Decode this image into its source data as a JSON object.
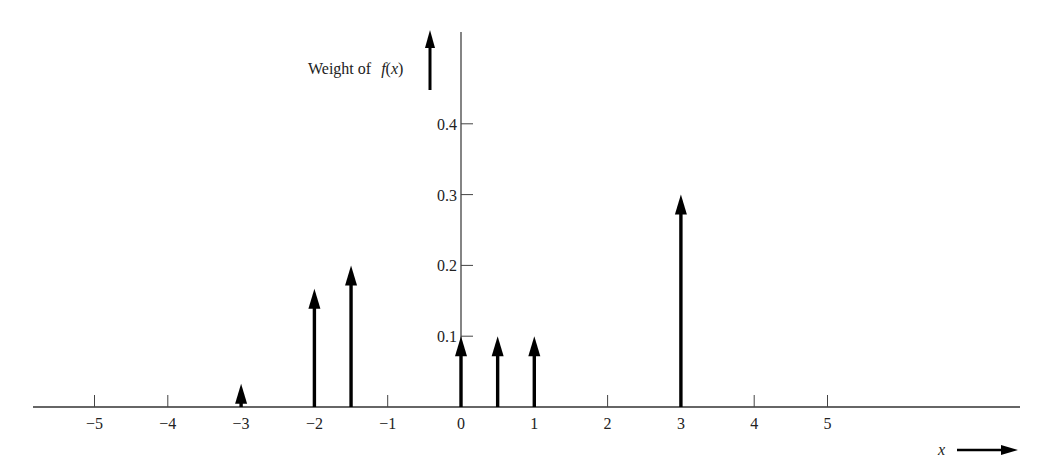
{
  "chart_data": {
    "type": "stem",
    "title": "",
    "xlabel": "x",
    "ylabel": "Weight of f(x)",
    "ylabel_parts": {
      "prefix": "Weight of ",
      "func": "f",
      "arg": "(x)"
    },
    "xlim": [
      -5.8,
      7.6
    ],
    "ylim": [
      0,
      0.45
    ],
    "x_ticks": [
      -5,
      -4,
      -3,
      -2,
      -1,
      0,
      1,
      2,
      3,
      4,
      5
    ],
    "x_tick_labels": [
      "−5",
      "−4",
      "−3",
      "−2",
      "−1",
      "0",
      "1",
      "2",
      "3",
      "4",
      "5"
    ],
    "y_ticks": [
      0.1,
      0.2,
      0.3,
      0.4
    ],
    "y_tick_labels": [
      "0.1",
      "0.2",
      "0.3",
      "0.4"
    ],
    "grid": false,
    "legend": null,
    "points": [
      {
        "x": -3,
        "weight": 0.033
      },
      {
        "x": -2,
        "weight": 0.167
      },
      {
        "x": -1.5,
        "weight": 0.2
      },
      {
        "x": 0,
        "weight": 0.1
      },
      {
        "x": 0.5,
        "weight": 0.1
      },
      {
        "x": 1,
        "weight": 0.1
      },
      {
        "x": 3,
        "weight": 0.3
      }
    ]
  }
}
